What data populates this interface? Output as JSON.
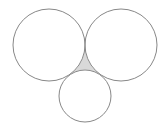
{
  "diagram": {
    "type": "tangent-circles",
    "background": "#ffffff",
    "stroke_color": "#888888",
    "shade_color": "#d9d9d9",
    "circles": [
      {
        "id": "left",
        "cx": 49,
        "cy": 45,
        "r": 36
      },
      {
        "id": "right",
        "cx": 121,
        "cy": 45,
        "r": 36
      },
      {
        "id": "bottom",
        "cx": 85,
        "cy": 96,
        "r": 26
      }
    ],
    "shaded_region": "curvilinear-triangle"
  }
}
